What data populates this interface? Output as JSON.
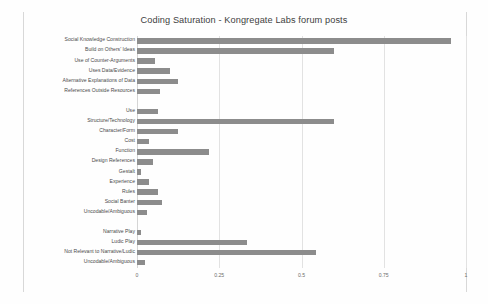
{
  "chart_data": {
    "type": "bar",
    "orientation": "horizontal",
    "title": "Coding Saturation - Kongregate Labs forum posts",
    "xlabel": "",
    "ylabel": "",
    "xlim": [
      0,
      1
    ],
    "xticks": [
      "0",
      "0.25",
      "0.5",
      "0.75",
      "1"
    ],
    "xtick_values": [
      0,
      0.25,
      0.5,
      0.75,
      1
    ],
    "grid": true,
    "legend": "none",
    "bar_color": "#8c8c8c",
    "categories": [
      "Social Knowledge Construction",
      "Build on Others' Ideas",
      "Use of Counter-Arguments",
      "Uses Data/Evidence",
      "Alternative Explanations of Data",
      "References Outside Resources",
      "",
      "Use",
      "Structure/Technology",
      "Character/Form",
      "Cost",
      "Function",
      "Design References",
      "Gestalt",
      "Experience",
      "Rules",
      "Social Banter",
      "Uncodable/Ambiguous",
      "",
      "Narrative Play",
      "Ludic Play",
      "Not Relevant to Narrative/Ludic",
      "Uncodable/Ambiguous"
    ],
    "values": [
      0.955,
      0.6,
      0.055,
      0.1,
      0.125,
      0.07,
      null,
      0.065,
      0.6,
      0.125,
      0.035,
      0.22,
      0.05,
      0.012,
      0.035,
      0.065,
      0.075,
      0.03,
      null,
      0.012,
      0.335,
      0.545,
      0.025
    ]
  }
}
